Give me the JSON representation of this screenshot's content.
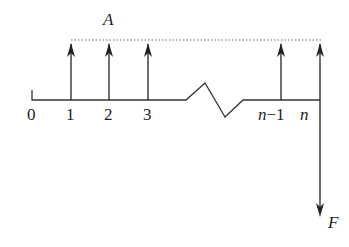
{
  "diagram": {
    "type": "cash-flow-diagram",
    "annuity_label": "A",
    "future_value_label": "F",
    "period_labels": [
      "0",
      "1",
      "2",
      "3",
      "n−1",
      "n"
    ],
    "label_0": "0",
    "label_1": "1",
    "label_2": "2",
    "label_3": "3",
    "label_n_minus_1_var": "n",
    "label_n_minus_1_rest": "−1",
    "label_n": "n",
    "colors": {
      "line": "#333333",
      "dotted": "#666666",
      "text": "#222222"
    }
  }
}
